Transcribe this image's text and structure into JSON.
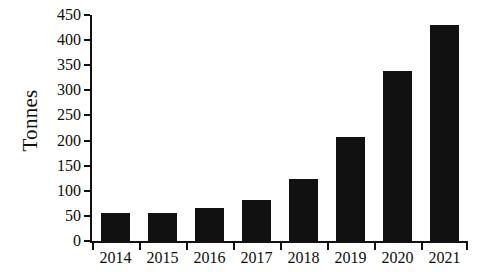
{
  "chart_data": {
    "type": "bar",
    "title": "",
    "xlabel": "",
    "ylabel": "Tonnes",
    "categories": [
      "2014",
      "2015",
      "2016",
      "2017",
      "2018",
      "2019",
      "2020",
      "2021"
    ],
    "values": [
      55,
      55,
      65,
      82,
      124,
      207,
      338,
      430
    ],
    "series": [
      {
        "name": "Tonnes",
        "values": [
          55,
          55,
          65,
          82,
          124,
          207,
          338,
          430
        ]
      }
    ],
    "ylim": [
      0,
      450
    ],
    "ytick_step": 50,
    "ytick_labels": [
      "0",
      "50",
      "100",
      "150",
      "200",
      "250",
      "300",
      "350",
      "400",
      "450"
    ],
    "ytick_values": [
      0,
      50,
      100,
      150,
      200,
      250,
      300,
      350,
      400,
      450
    ],
    "grid": false,
    "legend": null,
    "legend_position": "none",
    "bar_color": "#111111",
    "background_color": "#ffffff",
    "axis_color": "#111111",
    "xtick_position": "between-categories"
  }
}
